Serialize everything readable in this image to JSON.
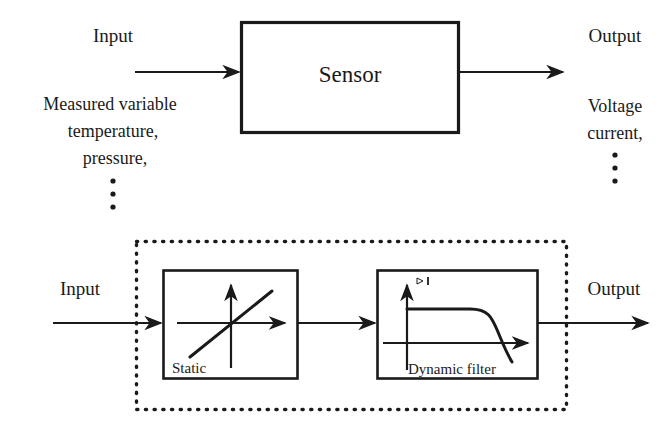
{
  "figure": {
    "line_color": "#1a1a1a",
    "background": "#ffffff"
  },
  "top_diagram": {
    "input_label": "Input",
    "output_label": "Output",
    "block_label": "Sensor",
    "input_examples": [
      "Measured variable",
      "temperature,",
      "pressure,"
    ],
    "input_ellipsis": "⋮",
    "output_examples": [
      "Voltage",
      "current,"
    ],
    "output_ellipsis": "⋮"
  },
  "bottom_diagram": {
    "input_label": "Input",
    "output_label": "Output",
    "blocks": [
      {
        "label": "Static",
        "icon": "linear-transfer-curve-icon",
        "description": "crossed axes with rising straight line"
      },
      {
        "label": "Dynamic filter",
        "icon": "lowpass-response-curve-icon",
        "description": "magnitude axis with flat passband then roll-off"
      }
    ],
    "group_border_style": "dotted"
  }
}
